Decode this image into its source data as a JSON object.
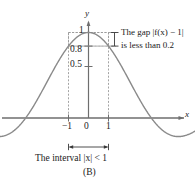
{
  "figure": {
    "panel_label": "(B)",
    "axis_labels": {
      "x": "x",
      "y": "y"
    },
    "y_ticks": [
      {
        "value": 1,
        "label": "1"
      },
      {
        "value": 0.8,
        "label": "0.8"
      },
      {
        "value": 0.5,
        "label": "0.5"
      }
    ],
    "x_ticks": [
      {
        "value": -1,
        "label": "−1"
      },
      {
        "value": 0,
        "label": "0"
      },
      {
        "value": 1,
        "label": "1"
      }
    ],
    "annotations": {
      "gap_line1": "The gap |f(x) − 1|",
      "gap_line2": "is less than 0.2",
      "interval": "The interval |x| < 1"
    },
    "colors": {
      "curve": "#8a8a8a",
      "axis": "#6e6e6e",
      "dashed": "#9a9a9a",
      "text": "#1a1a1a"
    }
  },
  "chart_data": {
    "type": "line",
    "title": "",
    "subtitle": "",
    "xlabel": "x",
    "ylabel": "y",
    "function": "f(x) = sin(x)/x",
    "xlim": [
      -5.6,
      5.6
    ],
    "ylim": [
      -0.33,
      1.12
    ],
    "grid": false,
    "legend": null,
    "x_ticks": [
      -1,
      0,
      1
    ],
    "x_tick_labels": [
      "−1",
      "0",
      "1"
    ],
    "y_ticks": [
      0.5,
      0.8,
      1
    ],
    "y_tick_labels": [
      "0.5",
      "0.8",
      "1"
    ],
    "series": [
      {
        "name": "sin(x)/x",
        "x": [
          -5.6,
          -5.2,
          -4.8,
          -4.4,
          -4.0,
          -3.6,
          -3.2,
          -2.8,
          -2.4,
          -2.0,
          -1.6,
          -1.2,
          -0.8,
          -0.4,
          0.0,
          0.4,
          0.8,
          1.2,
          1.6,
          2.0,
          2.4,
          2.8,
          3.2,
          3.6,
          4.0,
          4.4,
          4.8,
          5.2,
          5.6
        ],
        "y": [
          -0.113,
          -0.171,
          -0.206,
          -0.216,
          -0.189,
          -0.124,
          -0.018,
          0.12,
          0.281,
          0.455,
          0.625,
          0.777,
          0.897,
          0.974,
          1.0,
          0.974,
          0.897,
          0.777,
          0.625,
          0.455,
          0.281,
          0.12,
          -0.018,
          -0.124,
          -0.189,
          -0.216,
          -0.206,
          -0.171,
          -0.113
        ]
      }
    ],
    "annotations": [
      {
        "kind": "dashed-rect",
        "x0": -1,
        "x1": 1,
        "y0": 0.8,
        "y1": 1.0
      },
      {
        "kind": "v-dashed",
        "x": -1,
        "y0": 0,
        "y1": 1.0
      },
      {
        "kind": "v-dashed",
        "x": 1,
        "y0": 0,
        "y1": 1.0
      },
      {
        "kind": "gap-bracket",
        "y0": 0.8,
        "y1": 1.0,
        "text": "The gap |f(x) − 1| is less than 0.2"
      },
      {
        "kind": "interval-arrow",
        "x0": -1,
        "x1": 1,
        "text": "The interval |x| < 1"
      }
    ]
  }
}
